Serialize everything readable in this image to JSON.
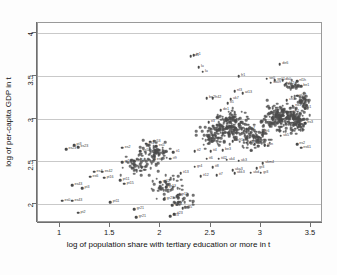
{
  "chart_data": {
    "type": "scatter",
    "title": "",
    "xlabel": "log of population share with tertiary education or more in t",
    "ylabel": "log of per-capita GDP in t",
    "xlim": [
      0.78,
      3.62
    ],
    "ylim": [
      1.78,
      4.12
    ],
    "xticks": [
      "1",
      "1.5",
      "2",
      "2.5",
      "3",
      "3.5"
    ],
    "xtick_values": [
      1,
      1.5,
      2,
      2.5,
      3,
      3.5
    ],
    "yticks": [
      "2",
      "2.5",
      "3",
      "3.5",
      "4"
    ],
    "ytick_values": [
      2,
      2.5,
      3,
      3.5,
      4
    ],
    "grid": "horizontal",
    "legend": "none",
    "marker_color": "#4a4a4a",
    "label_color": "#3c3c3c",
    "points": [
      {
        "x": 2.33,
        "y": 3.74,
        "label": "ie1"
      },
      {
        "x": 2.3,
        "y": 3.73,
        "label": "ad1"
      },
      {
        "x": 2.38,
        "y": 3.6,
        "label": "lu"
      },
      {
        "x": 2.42,
        "y": 3.55,
        "label": "lu"
      },
      {
        "x": 3.19,
        "y": 3.64,
        "label": "de6"
      },
      {
        "x": 2.78,
        "y": 3.5,
        "label": "fr1"
      },
      {
        "x": 3.06,
        "y": 3.47,
        "label": "se0"
      },
      {
        "x": 3.14,
        "y": 3.45,
        "label": "se01"
      },
      {
        "x": 3.22,
        "y": 3.45,
        "label": "dk0"
      },
      {
        "x": 3.36,
        "y": 3.44,
        "label": "nl1h"
      },
      {
        "x": 3.1,
        "y": 3.42,
        "label": "uk09"
      },
      {
        "x": 3.25,
        "y": 3.41,
        "label": "de2"
      },
      {
        "x": 3.4,
        "y": 3.38,
        "label": "be1"
      },
      {
        "x": 2.74,
        "y": 3.32,
        "label": "nl3"
      },
      {
        "x": 2.82,
        "y": 3.3,
        "label": "at13"
      },
      {
        "x": 3.36,
        "y": 3.27,
        "label": "at32"
      },
      {
        "x": 2.52,
        "y": 3.24,
        "label": "fr42"
      },
      {
        "x": 2.46,
        "y": 3.24,
        "label": "be2"
      },
      {
        "x": 2.7,
        "y": 3.23,
        "label": "uk7"
      },
      {
        "x": 3.26,
        "y": 3.22,
        "label": "ch3"
      },
      {
        "x": 2.67,
        "y": 3.18,
        "label": "it5"
      },
      {
        "x": 3.32,
        "y": 3.15,
        "label": "no1"
      },
      {
        "x": 3.44,
        "y": 3.12,
        "label": "fi1"
      },
      {
        "x": 2.6,
        "y": 3.1,
        "label": "de1"
      },
      {
        "x": 3.3,
        "y": 3.08,
        "label": "uk2"
      },
      {
        "x": 2.48,
        "y": 2.96,
        "label": "it3"
      },
      {
        "x": 3.44,
        "y": 2.95,
        "label": "es3"
      },
      {
        "x": 3.38,
        "y": 2.93,
        "label": "nl2"
      },
      {
        "x": 2.86,
        "y": 2.88,
        "label": "de7"
      },
      {
        "x": 3.02,
        "y": 2.84,
        "label": "fr6"
      },
      {
        "x": 3.2,
        "y": 2.8,
        "label": "uk5"
      },
      {
        "x": 2.72,
        "y": 2.74,
        "label": "de91"
      },
      {
        "x": 2.86,
        "y": 2.72,
        "label": "it12"
      },
      {
        "x": 2.94,
        "y": 2.7,
        "label": "it5"
      },
      {
        "x": 3.04,
        "y": 2.69,
        "label": "ukn"
      },
      {
        "x": 3.36,
        "y": 2.7,
        "label": "es2"
      },
      {
        "x": 3.4,
        "y": 2.66,
        "label": "es61"
      },
      {
        "x": 2.62,
        "y": 2.63,
        "label": "be3"
      },
      {
        "x": 2.5,
        "y": 2.62,
        "label": "it4"
      },
      {
        "x": 2.34,
        "y": 2.62,
        "label": "it2"
      },
      {
        "x": 2.13,
        "y": 2.61,
        "label": "it1"
      },
      {
        "x": 1.96,
        "y": 2.68,
        "label": "es5"
      },
      {
        "x": 1.86,
        "y": 2.71,
        "label": "es1"
      },
      {
        "x": 1.62,
        "y": 2.66,
        "label": "es2"
      },
      {
        "x": 1.9,
        "y": 2.73,
        "label": "es53"
      },
      {
        "x": 1.8,
        "y": 2.62,
        "label": "es54"
      },
      {
        "x": 1.14,
        "y": 2.69,
        "label": "pt3"
      },
      {
        "x": 1.18,
        "y": 2.67,
        "label": "es23"
      },
      {
        "x": 1.06,
        "y": 2.64,
        "label": "es23"
      },
      {
        "x": 2.58,
        "y": 2.53,
        "label": "it42"
      },
      {
        "x": 2.66,
        "y": 2.52,
        "label": "uk4"
      },
      {
        "x": 2.78,
        "y": 2.51,
        "label": "uk3"
      },
      {
        "x": 2.46,
        "y": 2.53,
        "label": "it6"
      },
      {
        "x": 2.1,
        "y": 2.53,
        "label": "it9"
      },
      {
        "x": 1.94,
        "y": 2.52,
        "label": "es6"
      },
      {
        "x": 1.74,
        "y": 2.5,
        "label": "es4"
      },
      {
        "x": 1.62,
        "y": 2.49,
        "label": "pt1"
      },
      {
        "x": 3.02,
        "y": 2.48,
        "label": "ukm4"
      },
      {
        "x": 2.34,
        "y": 2.44,
        "label": "gr4"
      },
      {
        "x": 2.52,
        "y": 2.43,
        "label": "it8"
      },
      {
        "x": 2.72,
        "y": 2.4,
        "label": "uka3"
      },
      {
        "x": 2.96,
        "y": 2.42,
        "label": "gr3"
      },
      {
        "x": 2.9,
        "y": 2.37,
        "label": "ukd"
      },
      {
        "x": 3.0,
        "y": 2.37,
        "label": "gr3"
      },
      {
        "x": 2.74,
        "y": 2.36,
        "label": "ukk3"
      },
      {
        "x": 2.2,
        "y": 2.36,
        "label": "it13"
      },
      {
        "x": 2.4,
        "y": 2.33,
        "label": "it12"
      },
      {
        "x": 2.56,
        "y": 2.34,
        "label": "it7"
      },
      {
        "x": 1.34,
        "y": 2.38,
        "label": "es4"
      },
      {
        "x": 1.42,
        "y": 2.38,
        "label": "es42"
      },
      {
        "x": 1.3,
        "y": 2.32,
        "label": "es6"
      },
      {
        "x": 1.44,
        "y": 2.31,
        "label": "pt16"
      },
      {
        "x": 1.6,
        "y": 2.28,
        "label": "pt11"
      },
      {
        "x": 1.64,
        "y": 2.24,
        "label": "pt15"
      },
      {
        "x": 1.12,
        "y": 2.22,
        "label": "es43"
      },
      {
        "x": 1.22,
        "y": 2.19,
        "label": "pt3"
      },
      {
        "x": 1.02,
        "y": 2.04,
        "label": "es0"
      },
      {
        "x": 1.12,
        "y": 2.04,
        "label": "es43"
      },
      {
        "x": 1.5,
        "y": 2.02,
        "label": "pt11"
      },
      {
        "x": 1.18,
        "y": 1.9,
        "label": "pt2"
      },
      {
        "x": 1.74,
        "y": 1.94,
        "label": "gr21"
      },
      {
        "x": 1.76,
        "y": 1.85,
        "label": "gr21"
      },
      {
        "x": 2.04,
        "y": 2.06,
        "label": "gr23"
      },
      {
        "x": 2.18,
        "y": 2.11,
        "label": "gr11"
      },
      {
        "x": 2.12,
        "y": 1.99,
        "label": "gr24"
      },
      {
        "x": 2.22,
        "y": 1.95,
        "label": "gr25"
      },
      {
        "x": 2.14,
        "y": 1.88,
        "label": "it23"
      },
      {
        "x": 2.1,
        "y": 1.86,
        "label": "it23"
      },
      {
        "x": 2.06,
        "y": 2.2,
        "label": "gr13"
      },
      {
        "x": 2.0,
        "y": 2.26,
        "label": "gr12"
      }
    ],
    "cluster_note": "dense overlapping scatter of several hundred NUTS-region observations, concentrated between x 2.3-3.5 and y 2.5-3.3, with a secondary band between x 1.5-2.3 and y 2.0-2.8"
  },
  "figure": {
    "background": "#ffffff",
    "frame_color": "#9a9a9a",
    "grid_color": "#c9c9c9",
    "axis_color": "#6f6f6f"
  }
}
